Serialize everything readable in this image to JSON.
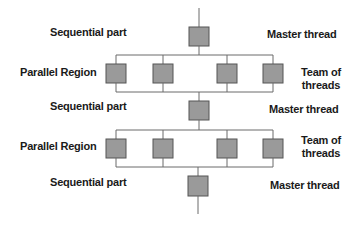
{
  "diagram": {
    "left_labels": {
      "sequential_1": "Sequential part",
      "parallel_1": "Parallel Region",
      "sequential_2": "Sequential part",
      "parallel_2": "Parallel Region",
      "sequential_3": "Sequential part"
    },
    "right_labels": {
      "master_1": "Master thread",
      "team_1_line1": "Team of",
      "team_1_line2": "threads",
      "master_2": "Master thread",
      "team_2_line1": "Team of",
      "team_2_line2": "threads",
      "master_3": "Master thread"
    },
    "phases": [
      {
        "type": "sequential",
        "threads": 1
      },
      {
        "type": "parallel",
        "threads": 4
      },
      {
        "type": "sequential",
        "threads": 1
      },
      {
        "type": "parallel",
        "threads": 4
      },
      {
        "type": "sequential",
        "threads": 1
      }
    ],
    "colors": {
      "box_fill": "#9a9a9a",
      "box_stroke": "#555555",
      "line": "#6a6a6a",
      "text": "#1a1a1a"
    }
  }
}
